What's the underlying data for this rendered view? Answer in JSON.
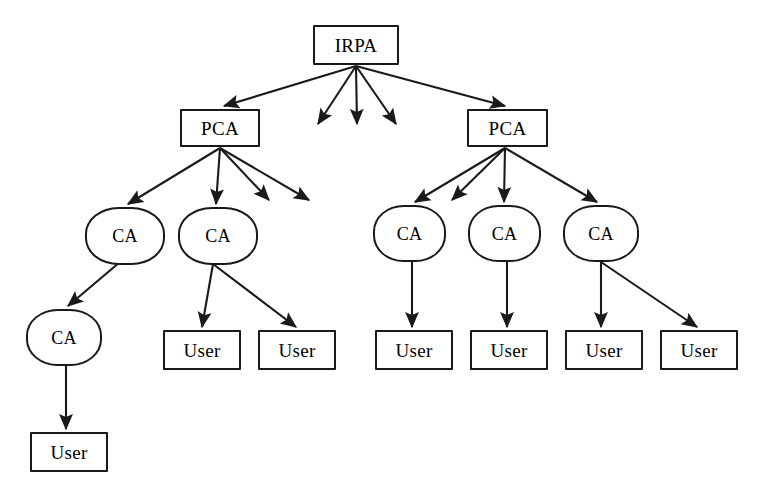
{
  "diagram": {
    "background_color": "#ffffff",
    "stroke_color": "#1a1a1a",
    "labels": {
      "root": "IRPA",
      "pca": "PCA",
      "ca": "CA",
      "user": "User"
    },
    "nodes": [
      {
        "id": "irpa",
        "label": "IRPA",
        "shape": "rect",
        "x": 313,
        "y": 25,
        "w": 86,
        "h": 40
      },
      {
        "id": "pca-l",
        "label": "PCA",
        "shape": "rect",
        "x": 180,
        "y": 109,
        "w": 80,
        "h": 38
      },
      {
        "id": "pca-r",
        "label": "PCA",
        "shape": "rect",
        "x": 467,
        "y": 109,
        "w": 81,
        "h": 38
      },
      {
        "id": "ca-l1",
        "label": "CA",
        "shape": "round",
        "x": 85,
        "y": 207,
        "w": 80,
        "h": 58
      },
      {
        "id": "ca-l2",
        "label": "CA",
        "shape": "round",
        "x": 178,
        "y": 207,
        "w": 80,
        "h": 58
      },
      {
        "id": "ca-l3",
        "label": "CA",
        "shape": "round",
        "x": 26,
        "y": 309,
        "w": 76,
        "h": 57
      },
      {
        "id": "ca-r1",
        "label": "CA",
        "shape": "round",
        "x": 373,
        "y": 205,
        "w": 73,
        "h": 57
      },
      {
        "id": "ca-r2",
        "label": "CA",
        "shape": "round",
        "x": 468,
        "y": 205,
        "w": 73,
        "h": 57
      },
      {
        "id": "ca-r3",
        "label": "CA",
        "shape": "round",
        "x": 563,
        "y": 205,
        "w": 76,
        "h": 57
      },
      {
        "id": "user-l1",
        "label": "User",
        "shape": "rect",
        "x": 163,
        "y": 330,
        "w": 78,
        "h": 40
      },
      {
        "id": "user-l2",
        "label": "User",
        "shape": "rect",
        "x": 258,
        "y": 330,
        "w": 78,
        "h": 40
      },
      {
        "id": "user-r1",
        "label": "User",
        "shape": "rect",
        "x": 375,
        "y": 330,
        "w": 78,
        "h": 40
      },
      {
        "id": "user-r2",
        "label": "User",
        "shape": "rect",
        "x": 470,
        "y": 330,
        "w": 78,
        "h": 40
      },
      {
        "id": "user-r3",
        "label": "User",
        "shape": "rect",
        "x": 565,
        "y": 330,
        "w": 78,
        "h": 40
      },
      {
        "id": "user-r4",
        "label": "User",
        "shape": "rect",
        "x": 660,
        "y": 330,
        "w": 78,
        "h": 40
      },
      {
        "id": "user-b1",
        "label": "User",
        "shape": "rect",
        "x": 30,
        "y": 432,
        "w": 78,
        "h": 40
      }
    ],
    "edges": [
      {
        "from": "irpa",
        "to": "pca-l",
        "x1": 356,
        "y1": 66,
        "x2": 224,
        "y2": 106
      },
      {
        "from": "irpa",
        "to": "pca-r",
        "x1": 356,
        "y1": 66,
        "x2": 505,
        "y2": 106
      },
      {
        "from": "irpa",
        "to": null,
        "x1": 356,
        "y1": 66,
        "x2": 318,
        "y2": 124
      },
      {
        "from": "irpa",
        "to": null,
        "x1": 356,
        "y1": 66,
        "x2": 357,
        "y2": 124
      },
      {
        "from": "irpa",
        "to": null,
        "x1": 356,
        "y1": 66,
        "x2": 396,
        "y2": 124
      },
      {
        "from": "pca-l",
        "to": "ca-l1",
        "x1": 220,
        "y1": 148,
        "x2": 128,
        "y2": 204
      },
      {
        "from": "pca-l",
        "to": "ca-l2",
        "x1": 220,
        "y1": 148,
        "x2": 216,
        "y2": 204
      },
      {
        "from": "pca-l",
        "to": null,
        "x1": 220,
        "y1": 148,
        "x2": 269,
        "y2": 200
      },
      {
        "from": "pca-l",
        "to": null,
        "x1": 220,
        "y1": 148,
        "x2": 309,
        "y2": 200
      },
      {
        "from": "pca-r",
        "to": "ca-r1",
        "x1": 505,
        "y1": 148,
        "x2": 415,
        "y2": 202
      },
      {
        "from": "pca-r",
        "to": "ca-r2",
        "x1": 505,
        "y1": 148,
        "x2": 504,
        "y2": 202
      },
      {
        "from": "pca-r",
        "to": "ca-r3",
        "x1": 505,
        "y1": 148,
        "x2": 597,
        "y2": 202
      },
      {
        "from": "pca-r",
        "to": null,
        "x1": 505,
        "y1": 148,
        "x2": 452,
        "y2": 200
      },
      {
        "from": "ca-l1",
        "to": "ca-l3",
        "x1": 120,
        "y1": 262,
        "x2": 68,
        "y2": 306
      },
      {
        "from": "ca-l2",
        "to": "user-l1",
        "x1": 213,
        "y1": 264,
        "x2": 202,
        "y2": 327
      },
      {
        "from": "ca-l2",
        "to": "user-l2",
        "x1": 213,
        "y1": 264,
        "x2": 296,
        "y2": 327
      },
      {
        "from": "ca-l3",
        "to": "user-b1",
        "x1": 66,
        "y1": 366,
        "x2": 66,
        "y2": 429
      },
      {
        "from": "ca-r1",
        "to": "user-r1",
        "x1": 412,
        "y1": 262,
        "x2": 412,
        "y2": 327
      },
      {
        "from": "ca-r2",
        "to": "user-r2",
        "x1": 507,
        "y1": 262,
        "x2": 507,
        "y2": 327
      },
      {
        "from": "ca-r3",
        "to": "user-r3",
        "x1": 601,
        "y1": 262,
        "x2": 601,
        "y2": 327
      },
      {
        "from": "ca-r3",
        "to": "user-r4",
        "x1": 601,
        "y1": 262,
        "x2": 697,
        "y2": 327
      }
    ]
  }
}
